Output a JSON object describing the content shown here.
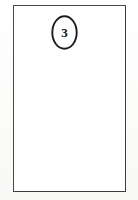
{
  "figure": {
    "background_color": "#fbfbfa",
    "panel": {
      "name": "panel-frame",
      "fill_color": "#ffffff",
      "border_color": "#4a4a4c",
      "border_width_px": 1,
      "content": ""
    },
    "callout": {
      "label": "3",
      "shape": "ellipse",
      "stroke_color": "#1d1d1f",
      "fill_color": "#ffffff",
      "text_color": "#161618"
    }
  }
}
